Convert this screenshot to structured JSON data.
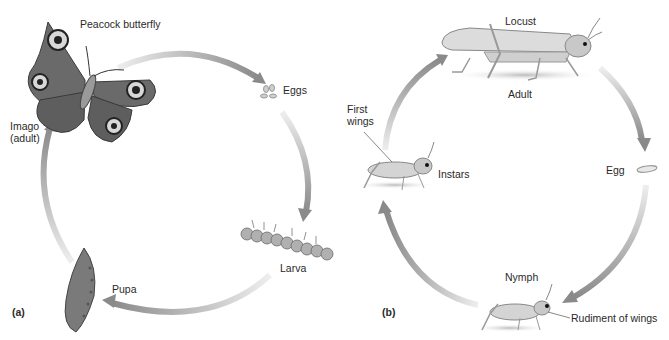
{
  "panels": [
    {
      "id": "a",
      "label": "(a)",
      "title": "Complete metamorphosis",
      "stages": [
        {
          "name": "Peacock butterfly",
          "type": "organism-label"
        },
        {
          "name": "Eggs",
          "type": "stage"
        },
        {
          "name": "Larva",
          "type": "stage"
        },
        {
          "name": "Pupa",
          "type": "stage"
        },
        {
          "name": "Imago (adult)",
          "line1": "Imago",
          "line2": "(adult)",
          "type": "stage"
        }
      ]
    },
    {
      "id": "b",
      "label": "(b)",
      "title": "Incomplete metamorphosis",
      "stages": [
        {
          "name": "Locust",
          "type": "organism-label"
        },
        {
          "name": "Adult",
          "type": "stage"
        },
        {
          "name": "Egg",
          "type": "stage"
        },
        {
          "name": "Nymph",
          "type": "stage"
        },
        {
          "name": "Rudiment of wings",
          "type": "annotation"
        },
        {
          "name": "Instars",
          "type": "stage"
        },
        {
          "name": "First wings",
          "line1": "First",
          "line2": "wings",
          "type": "annotation"
        }
      ]
    }
  ],
  "colors": {
    "arrow": "#8a8a8a",
    "arrow_fade": "#e6e6e6",
    "butterfly_wing": "#6e6e6e",
    "butterfly_dark": "#3a3a3a",
    "insect_body": "#c9c9c9",
    "text": "#2a2a2a"
  }
}
